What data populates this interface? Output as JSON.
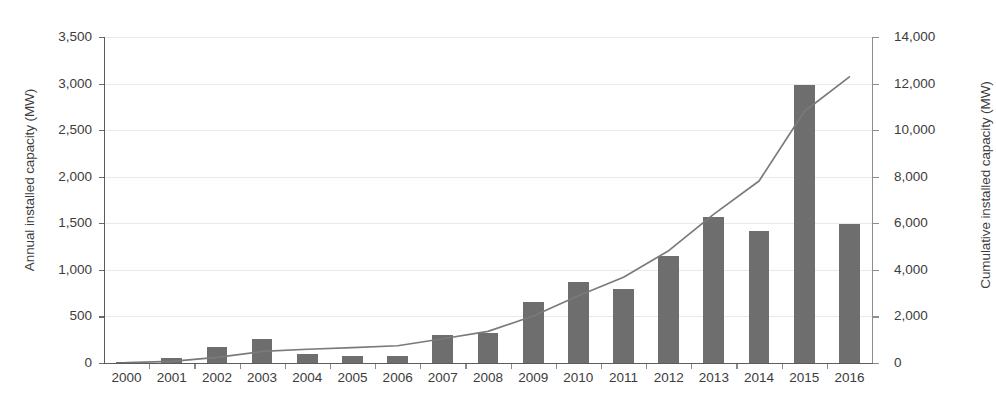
{
  "chart_data": {
    "type": "bar",
    "title": "",
    "subtitle": "",
    "xlabel": "",
    "ylabel": "Annual installed capacity (MW)",
    "y2label": "Cumulative installed capacity (MW)",
    "grid": true,
    "legend": "none",
    "categories": [
      "2000",
      "2001",
      "2002",
      "2003",
      "2004",
      "2005",
      "2006",
      "2007",
      "2008",
      "2009",
      "2010",
      "2011",
      "2012",
      "2013",
      "2014",
      "2015",
      "2016"
    ],
    "ylim": [
      0,
      3500
    ],
    "y2lim": [
      0,
      14000
    ],
    "yticks": [
      "0",
      "500",
      "1,000",
      "1,500",
      "2,000",
      "2,500",
      "3,000",
      "3,500"
    ],
    "ytick_values": [
      0,
      500,
      1000,
      1500,
      2000,
      2500,
      3000,
      3500
    ],
    "y2ticks": [
      "0",
      "2,000",
      "4,000",
      "6,000",
      "8,000",
      "10,000",
      "12,000",
      "14,000"
    ],
    "y2tick_values": [
      0,
      2000,
      4000,
      6000,
      8000,
      10000,
      12000,
      14000
    ],
    "series": [
      {
        "name": "Annual installed capacity",
        "type": "bar",
        "axis": "left",
        "color": "#6e6e6e",
        "values": [
          5,
          50,
          170,
          255,
          95,
          70,
          80,
          300,
          320,
          660,
          865,
          795,
          1145,
          1570,
          1420,
          2985,
          1490
        ]
      },
      {
        "name": "Cumulative installed capacity",
        "type": "line",
        "axis": "right",
        "color": "#7a7a7a",
        "values": [
          20,
          70,
          240,
          495,
          590,
          660,
          740,
          1040,
          1360,
          2020,
          2885,
          3680,
          4825,
          6395,
          7815,
          10800,
          12290
        ]
      }
    ]
  },
  "axes": {
    "left_title": "Annual installed capacity (MW)",
    "right_title": "Cumulative installed capacity (MW)"
  }
}
